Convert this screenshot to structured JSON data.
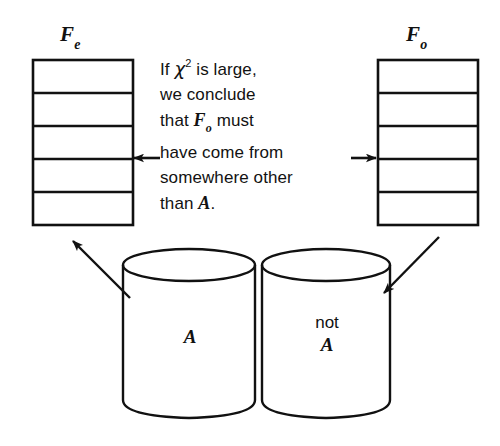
{
  "figure": {
    "background_color": "#ffffff",
    "stroke_color": "#111111"
  },
  "tables": {
    "expected": {
      "label_symbol": "F",
      "label_subscript": "e",
      "rows": 5,
      "x": 33,
      "y": 60,
      "width": 100,
      "height": 165
    },
    "observed": {
      "label_symbol": "F",
      "label_subscript": "o",
      "rows": 5,
      "x": 378,
      "y": 60,
      "width": 100,
      "height": 165
    }
  },
  "caption": {
    "lines": [
      "If χ² is  large,",
      "we conclude",
      "that Fₒ must",
      "have come from",
      "somewhere other",
      "than A."
    ],
    "line1_prefix": "If",
    "chi": "χ",
    "chi_exponent": "2",
    "line1_suffix": "is  large,",
    "line2": "we conclude",
    "line3_prefix": "that",
    "line3_symbol": "F",
    "line3_subscript": "o",
    "line3_suffix": "must",
    "line4": "have come from",
    "line5": "somewhere other",
    "line6_prefix": "than",
    "line6_symbol": "A",
    "line6_suffix": "."
  },
  "cylinders": [
    {
      "name": "population-a",
      "label_prefix": "",
      "label_symbol": "A",
      "x": 123,
      "y": 250,
      "width": 132,
      "height": 168
    },
    {
      "name": "population-not-a",
      "label_prefix": "not",
      "label_symbol": "A",
      "x": 262,
      "y": 250,
      "width": 128,
      "height": 168
    }
  ],
  "arrows": {
    "left_horizontal": {
      "direction": "left",
      "from_x": 158,
      "to_x": 133,
      "y": 158
    },
    "right_horizontal": {
      "direction": "right",
      "from_x": 352,
      "to_x": 377,
      "y": 158
    },
    "left_diagonal": {
      "direction": "up-left",
      "from_x": 128,
      "to_x": 72,
      "from_y": 296,
      "to_y": 240
    },
    "right_diagonal": {
      "direction": "down-left",
      "from_x": 437,
      "to_x": 385,
      "from_y": 238,
      "to_y": 294
    }
  }
}
